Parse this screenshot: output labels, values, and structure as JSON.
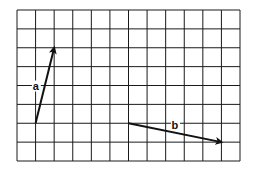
{
  "diagram": {
    "type": "vector-grid",
    "grid": {
      "columns": 12,
      "rows": 8
    },
    "vectors": [
      {
        "label": "a",
        "from": [
          1,
          2
        ],
        "to": [
          2,
          6
        ]
      },
      {
        "label": "b",
        "from": [
          6,
          2
        ],
        "to": [
          11,
          1
        ]
      }
    ],
    "colors": {
      "grid": "#1a1a1a",
      "vector": "#111111",
      "background": "#ffffff"
    }
  }
}
